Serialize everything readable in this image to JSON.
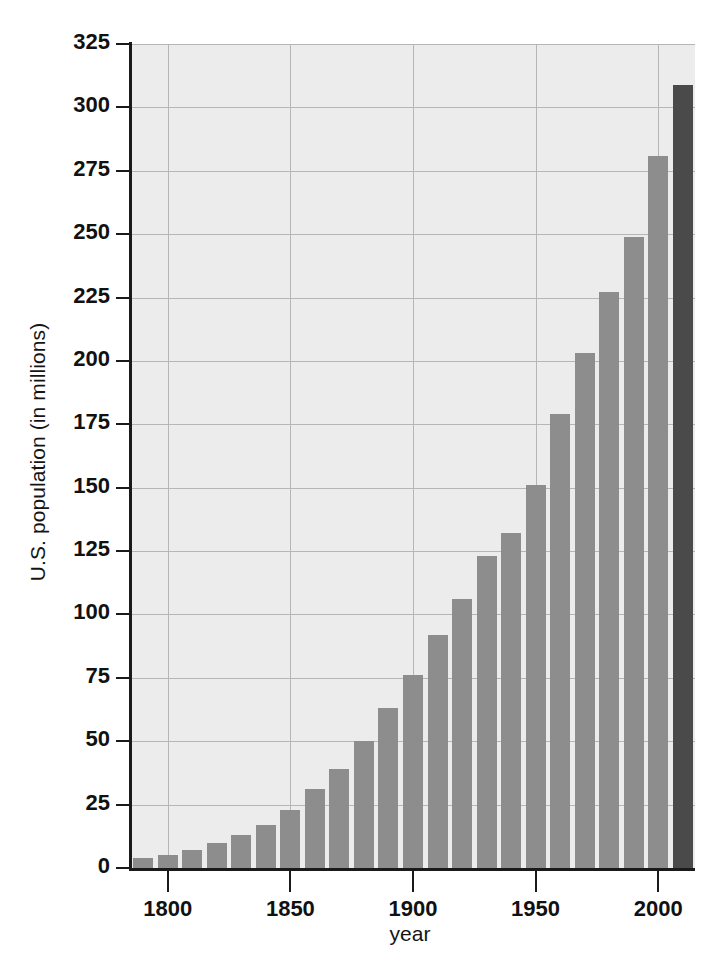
{
  "chart_data": {
    "type": "bar",
    "title": "",
    "xlabel": "year",
    "ylabel": "U.S. population (in millions)",
    "xlim": [
      1785,
      2015
    ],
    "ylim": [
      0,
      325
    ],
    "ytick_values": [
      0,
      25,
      50,
      75,
      100,
      125,
      150,
      175,
      200,
      225,
      250,
      275,
      300,
      325
    ],
    "ytick_labels": [
      "0",
      "25",
      "50",
      "75",
      "100",
      "125",
      "150",
      "175",
      "200",
      "225",
      "250",
      "275",
      "300",
      "325"
    ],
    "xtick_values": [
      1800,
      1850,
      1900,
      1950,
      2000
    ],
    "xtick_labels": [
      "1800",
      "1850",
      "1900",
      "1950",
      "2000"
    ],
    "grid": true,
    "legend": "none",
    "bar_color": "#8d8d8d",
    "projected_bar_color": "#4a4a4a",
    "plot_background": "#ececec",
    "grid_color": "#b6b6b6",
    "axis_color": "#1a1a1a",
    "categories": [
      1790,
      1800,
      1810,
      1820,
      1830,
      1840,
      1850,
      1860,
      1870,
      1880,
      1890,
      1900,
      1910,
      1920,
      1930,
      1940,
      1950,
      1960,
      1970,
      1980,
      1990,
      2000,
      2010
    ],
    "values": [
      4,
      5,
      7,
      10,
      13,
      17,
      23,
      31,
      39,
      50,
      63,
      76,
      92,
      106,
      123,
      132,
      151,
      179,
      203,
      227,
      249,
      281,
      309
    ],
    "bars": [
      {
        "year": "1790",
        "value": 4,
        "projected": false
      },
      {
        "year": "1800",
        "value": 5,
        "projected": false
      },
      {
        "year": "1810",
        "value": 7,
        "projected": false
      },
      {
        "year": "1820",
        "value": 10,
        "projected": false
      },
      {
        "year": "1830",
        "value": 13,
        "projected": false
      },
      {
        "year": "1840",
        "value": 17,
        "projected": false
      },
      {
        "year": "1850",
        "value": 23,
        "projected": false
      },
      {
        "year": "1860",
        "value": 31,
        "projected": false
      },
      {
        "year": "1870",
        "value": 39,
        "projected": false
      },
      {
        "year": "1880",
        "value": 50,
        "projected": false
      },
      {
        "year": "1890",
        "value": 63,
        "projected": false
      },
      {
        "year": "1900",
        "value": 76,
        "projected": false
      },
      {
        "year": "1910",
        "value": 92,
        "projected": false
      },
      {
        "year": "1920",
        "value": 106,
        "projected": false
      },
      {
        "year": "1930",
        "value": 123,
        "projected": false
      },
      {
        "year": "1940",
        "value": 132,
        "projected": false
      },
      {
        "year": "1950",
        "value": 151,
        "projected": false
      },
      {
        "year": "1960",
        "value": 179,
        "projected": false
      },
      {
        "year": "1970",
        "value": 203,
        "projected": false
      },
      {
        "year": "1980",
        "value": 227,
        "projected": false
      },
      {
        "year": "1990",
        "value": 249,
        "projected": false
      },
      {
        "year": "2000",
        "value": 281,
        "projected": false
      },
      {
        "year": "2010",
        "value": 309,
        "projected": true
      }
    ]
  }
}
